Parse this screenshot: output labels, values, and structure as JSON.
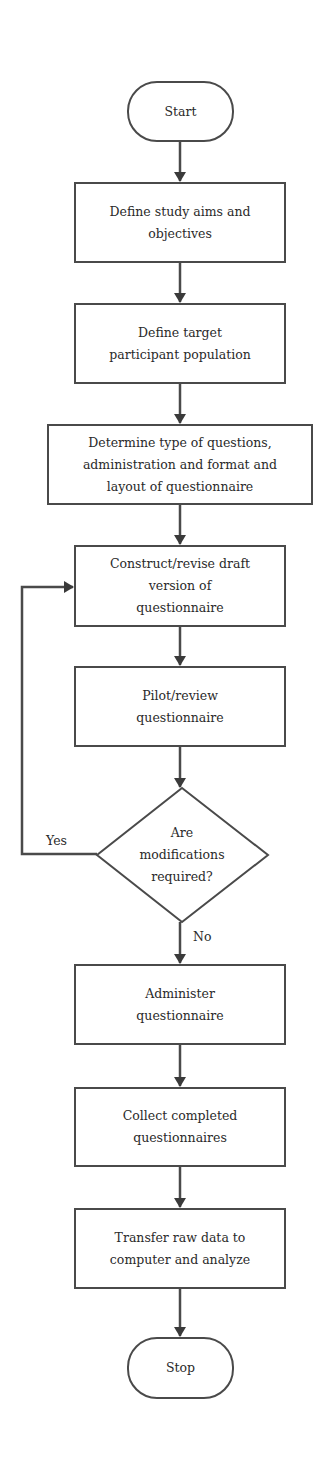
{
  "diagram": {
    "type": "flowchart",
    "nodes": {
      "start": {
        "shape": "terminal",
        "label": "Start"
      },
      "aims": {
        "shape": "process",
        "lines": [
          "Define study aims and",
          "objectives"
        ]
      },
      "population": {
        "shape": "process",
        "lines": [
          "Define target",
          "participant population"
        ]
      },
      "question_type": {
        "shape": "process",
        "lines": [
          "Determine type of questions,",
          "administration and format and",
          "layout of questionnaire"
        ]
      },
      "draft": {
        "shape": "process",
        "lines": [
          "Construct/revise draft",
          "version of",
          "questionnaire"
        ]
      },
      "pilot": {
        "shape": "process",
        "lines": [
          "Pilot/review",
          "questionnaire"
        ]
      },
      "decision": {
        "shape": "decision",
        "lines": [
          "Are",
          "modifications",
          "required?"
        ]
      },
      "administer": {
        "shape": "process",
        "lines": [
          "Administer",
          "questionnaire"
        ]
      },
      "collect": {
        "shape": "process",
        "lines": [
          "Collect completed",
          "questionnaires"
        ]
      },
      "transfer": {
        "shape": "process",
        "lines": [
          "Transfer raw data to",
          "computer and analyze"
        ]
      },
      "stop": {
        "shape": "terminal",
        "label": "Stop"
      }
    },
    "edges": [
      {
        "from": "start",
        "to": "aims"
      },
      {
        "from": "aims",
        "to": "population"
      },
      {
        "from": "population",
        "to": "question_type"
      },
      {
        "from": "question_type",
        "to": "draft"
      },
      {
        "from": "draft",
        "to": "pilot"
      },
      {
        "from": "pilot",
        "to": "decision"
      },
      {
        "from": "decision",
        "to": "draft",
        "label": "Yes"
      },
      {
        "from": "decision",
        "to": "administer",
        "label": "No"
      },
      {
        "from": "administer",
        "to": "collect"
      },
      {
        "from": "collect",
        "to": "transfer"
      },
      {
        "from": "transfer",
        "to": "stop"
      }
    ],
    "edge_labels": {
      "yes": "Yes",
      "no": "No"
    },
    "colors": {
      "stroke": "#4a4a4a",
      "fill": "#ffffff",
      "text": "#2a2a2a"
    }
  }
}
